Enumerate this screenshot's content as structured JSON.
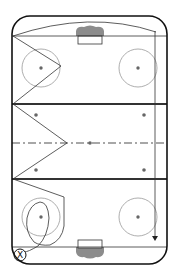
{
  "diagram": {
    "type": "hockey-rink-drill",
    "orientation": "vertical",
    "colors": {
      "boards": "#111111",
      "lines": "#222222",
      "circles": "#999999",
      "center_line": "#8a8a8a",
      "goal_fill": "#8c8c8c",
      "drill_path": "#333333",
      "background": "#ffffff"
    },
    "rink": {
      "x": 12,
      "y": 16,
      "width": 155,
      "height": 248,
      "corner_radius": 18
    },
    "goal_lines_y": [
      36,
      247
    ],
    "blue_lines_y": [
      104,
      179
    ],
    "center_line_y": 143,
    "faceoff_circles": [
      {
        "cx": 41,
        "cy": 68,
        "r": 19
      },
      {
        "cx": 138,
        "cy": 68,
        "r": 19
      },
      {
        "cx": 41,
        "cy": 217,
        "r": 19
      },
      {
        "cx": 138,
        "cy": 217,
        "r": 19
      }
    ],
    "neutral_dots": [
      {
        "cx": 36,
        "cy": 115
      },
      {
        "cx": 144,
        "cy": 115
      },
      {
        "cx": 36,
        "cy": 170
      },
      {
        "cx": 144,
        "cy": 170
      },
      {
        "cx": 90,
        "cy": 143
      }
    ],
    "goals": [
      {
        "x": 77,
        "y": 28,
        "w": 26,
        "h": 8,
        "pos": "top"
      },
      {
        "x": 77,
        "y": 247,
        "w": 26,
        "h": 8,
        "pos": "bottom"
      }
    ],
    "player_marker": {
      "label": "X",
      "cx": 20,
      "cy": 255,
      "r": 6
    },
    "arrow_end": {
      "x": 153,
      "y": 240
    }
  }
}
